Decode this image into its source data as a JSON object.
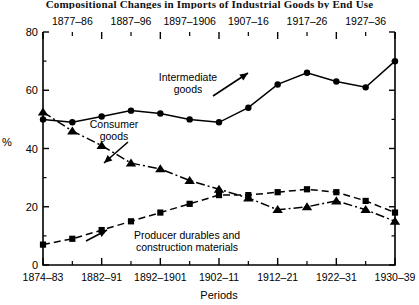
{
  "title": "Compositional Changes in Imports of Industrial Goods by End Use",
  "axis": {
    "y_label": "%",
    "x_label": "Periods",
    "y_ticks": [
      "0",
      "20",
      "40",
      "60",
      "80"
    ],
    "x_ticks_bottom": [
      "1874–83",
      "1882–91",
      "1892–1901",
      "1902–11",
      "1912–21",
      "1922–31",
      "1930–39"
    ],
    "x_ticks_top": [
      "1877–86",
      "1887–96",
      "1897–1906",
      "1907–16",
      "1917–26",
      "1927–36"
    ]
  },
  "annotations": [
    {
      "text_line1": "Intermediate",
      "text_line2": "goods"
    },
    {
      "text_line1": "Consumer",
      "text_line2": "goods"
    },
    {
      "text_line1": "Producer durables and",
      "text_line2": "construction materials"
    }
  ],
  "chart_data": {
    "type": "line",
    "title": "Compositional Changes in Imports of Industrial Goods by End Use",
    "xlabel": "Periods",
    "ylabel": "%",
    "ylim": [
      0,
      80
    ],
    "ytick_step": 20,
    "yminor_step": 10,
    "grid": false,
    "legend": "inline-annotations",
    "categories": [
      "1874–83",
      "1877–86",
      "1882–91",
      "1887–96",
      "1892–1901",
      "1897–1906",
      "1902–11",
      "1907–16",
      "1912–21",
      "1917–26",
      "1922–31",
      "1927–36",
      "1930–39"
    ],
    "series": [
      {
        "name": "Intermediate goods",
        "marker": "circle",
        "line_style": "solid",
        "values": [
          50,
          49,
          51,
          53,
          52,
          50,
          49,
          54,
          62,
          66,
          63,
          61,
          70
        ]
      },
      {
        "name": "Consumer goods",
        "marker": "triangle",
        "line_style": "dash-dot",
        "values": [
          52.5,
          46,
          41,
          35,
          33,
          29,
          26,
          23,
          19,
          20,
          22,
          19,
          15
        ]
      },
      {
        "name": "Producer durables and construction materials",
        "marker": "square",
        "line_style": "dashed",
        "values": [
          7,
          9,
          12,
          15,
          18,
          21,
          24,
          24,
          25,
          26,
          25,
          22,
          18
        ]
      }
    ]
  }
}
